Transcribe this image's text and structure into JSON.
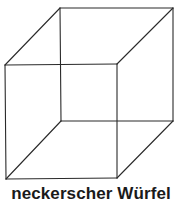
{
  "figure": {
    "caption": "neckerscher Würfel",
    "line_color": "#2a2a2a",
    "background": "#ffffff",
    "vertices": {
      "back_top_left": [
        60,
        8
      ],
      "back_top_right": [
        173,
        8
      ],
      "back_bottom_left": [
        61,
        121
      ],
      "back_bottom_right": [
        173,
        121
      ],
      "front_top_left": [
        5,
        65
      ],
      "front_top_right": [
        117,
        64
      ],
      "front_bottom_left": [
        6,
        179
      ],
      "front_bottom_right": [
        117,
        178
      ]
    }
  }
}
